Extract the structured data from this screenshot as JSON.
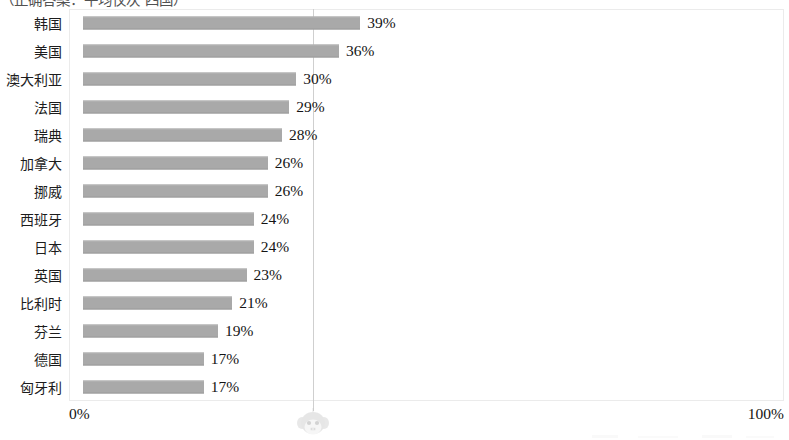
{
  "caption": "（正确答案：平均仅次 四国）",
  "axis": {
    "min_label": "0%",
    "max_label": "100%",
    "gridline_value": 50
  },
  "colors": {
    "bar": "#a9a9a9",
    "gridline": "#cfcfcf",
    "frame": "#ebebeb",
    "text": "#141414"
  },
  "icons": {
    "watermark": "monkey-face-watermark"
  },
  "chart_data": {
    "type": "bar",
    "orientation": "horizontal",
    "title": "",
    "xlabel": "",
    "ylabel": "",
    "xlim": [
      0,
      100
    ],
    "grid": true,
    "legend": "none",
    "categories": [
      "韩国",
      "美国",
      "澳大利亚",
      "法国",
      "瑞典",
      "加拿大",
      "挪威",
      "西班牙",
      "日本",
      "英国",
      "比利时",
      "芬兰",
      "德国",
      "匈牙利"
    ],
    "values": [
      39,
      36,
      30,
      29,
      28,
      26,
      26,
      24,
      24,
      23,
      21,
      19,
      17,
      17
    ],
    "value_labels": [
      "39%",
      "36%",
      "30%",
      "29%",
      "28%",
      "26%",
      "26%",
      "24%",
      "24%",
      "23%",
      "21%",
      "19%",
      "17%",
      "17%"
    ],
    "tick_labels": [
      "0%",
      "100%"
    ]
  }
}
